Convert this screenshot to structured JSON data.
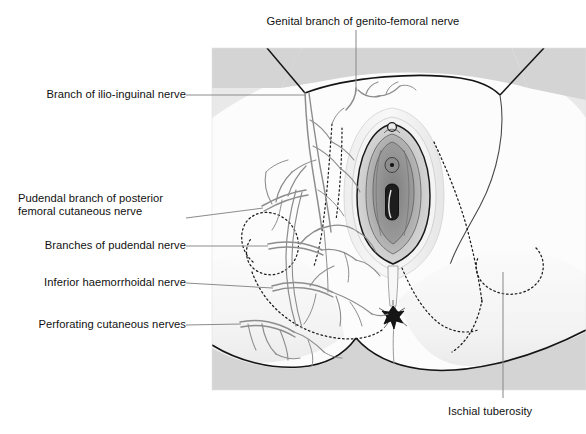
{
  "figure": {
    "title_alt": "Nerve supply of the female perineum",
    "panel": {
      "background_color": "#eaeaea",
      "skin_color": "#fcfcfc",
      "thigh_color": "#d2d2d2",
      "outline_color": "#1a1a1a",
      "nerve_color": "#8a8a8a",
      "leader_color": "#8c8c8c"
    }
  },
  "labels": {
    "top": {
      "text": "Genital branch of genito-femoral nerve",
      "leader": "vertical-line-down"
    },
    "left": [
      {
        "id": "ilio-inguinal",
        "text": "Branch of ilio-inguinal nerve"
      },
      {
        "id": "pudendal-branch-pfcn-line1",
        "text": "Pudendal branch of posterior"
      },
      {
        "id": "pudendal-branch-pfcn-line2",
        "text": "femoral cutaneous nerve"
      },
      {
        "id": "branches-pudendal",
        "text": "Branches of pudendal nerve"
      },
      {
        "id": "inferior-haemorrhoidal",
        "text": "Inferior haemorrhoidal nerve"
      },
      {
        "id": "perforating-cutaneous",
        "text": "Perforating cutaneous nerves"
      }
    ],
    "bottom_right": {
      "text": "Ischial tuberosity",
      "leader": "vertical-line-up"
    }
  },
  "anatomy": {
    "structures": [
      "left thigh",
      "right thigh",
      "mons / anterior perineum",
      "labium majus left",
      "labium majus right",
      "labium minus",
      "clitoris",
      "external urethral orifice",
      "vaginal orifice",
      "perineal body",
      "anus",
      "ischiorectal fossa boundary (dotted)",
      "ischial tuberosity (dotted)",
      "buttock left",
      "buttock right"
    ]
  }
}
